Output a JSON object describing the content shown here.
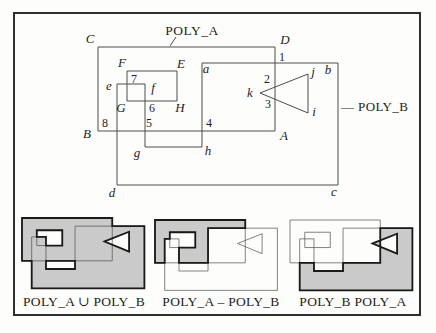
{
  "colors": {
    "paper": "#fdfdfb",
    "frame_stroke": "#2f2f2f",
    "thin_line": "#4d4d4d",
    "thick_line": "#1a1a1a",
    "region_gray": "#cacaca",
    "text": "#1d1d1d"
  },
  "frame": {
    "x": 14,
    "y": 13,
    "w": 406,
    "h": 302
  },
  "diagram": {
    "title": "POLY_A",
    "title_pointer": {
      "x1": 176,
      "y1": 37,
      "x2": 170,
      "y2": 46
    },
    "polyB_label": "— POLY_B",
    "shapes": {
      "polyA": [
        [
          98,
          47
        ],
        [
          275,
          47
        ],
        [
          275,
          131
        ],
        [
          98,
          131
        ]
      ],
      "holeA": [
        [
          127,
          71
        ],
        [
          177,
          71
        ],
        [
          177,
          101
        ],
        [
          127,
          101
        ]
      ],
      "polyB": [
        [
          202,
          63
        ],
        [
          338,
          63
        ],
        [
          338,
          185
        ],
        [
          117,
          185
        ],
        [
          117,
          84
        ],
        [
          145,
          84
        ],
        [
          145,
          147
        ],
        [
          202,
          147
        ]
      ],
      "triangle": [
        [
          260,
          93
        ],
        [
          308,
          74
        ],
        [
          308,
          113
        ]
      ]
    },
    "vertex_labels": [
      {
        "t": "C",
        "x": 90,
        "y": 43
      },
      {
        "t": "D",
        "x": 285,
        "y": 44
      },
      {
        "t": "B",
        "x": 87,
        "y": 138
      },
      {
        "t": "A",
        "x": 284,
        "y": 140
      },
      {
        "t": "F",
        "x": 122,
        "y": 67
      },
      {
        "t": "E",
        "x": 181,
        "y": 68
      },
      {
        "t": "G",
        "x": 121,
        "y": 112
      },
      {
        "t": "H",
        "x": 180,
        "y": 112
      },
      {
        "t": "a",
        "x": 206,
        "y": 73
      },
      {
        "t": "b",
        "x": 328,
        "y": 74
      },
      {
        "t": "c",
        "x": 334,
        "y": 196
      },
      {
        "t": "d",
        "x": 112,
        "y": 197
      },
      {
        "t": "e",
        "x": 109,
        "y": 90
      },
      {
        "t": "f",
        "x": 153,
        "y": 92
      },
      {
        "t": "g",
        "x": 137,
        "y": 157
      },
      {
        "t": "h",
        "x": 208,
        "y": 155
      },
      {
        "t": "j",
        "x": 313,
        "y": 76
      },
      {
        "t": "i",
        "x": 314,
        "y": 116
      },
      {
        "t": "k",
        "x": 250,
        "y": 97
      }
    ],
    "intersection_labels": [
      {
        "t": "1",
        "x": 282,
        "y": 61
      },
      {
        "t": "2",
        "x": 267,
        "y": 83
      },
      {
        "t": "3",
        "x": 268,
        "y": 108
      },
      {
        "t": "4",
        "x": 209,
        "y": 127
      },
      {
        "t": "5",
        "x": 149,
        "y": 127
      },
      {
        "t": "6",
        "x": 152,
        "y": 112
      },
      {
        "t": "7",
        "x": 134,
        "y": 83
      },
      {
        "t": "8",
        "x": 105,
        "y": 127
      }
    ]
  },
  "panels": [
    {
      "label": "POLY_A ∪ POLY_B",
      "label_x": 84,
      "label_y": 306,
      "origin": [
        22,
        218
      ],
      "scale": 0.51,
      "result": {
        "outer": [
          [
            98,
            47
          ],
          [
            275,
            47
          ],
          [
            275,
            63
          ],
          [
            338,
            63
          ],
          [
            338,
            185
          ],
          [
            117,
            185
          ],
          [
            117,
            131
          ],
          [
            98,
            131
          ]
        ],
        "holes": [
          [
            [
              127,
              71
            ],
            [
              177,
              71
            ],
            [
              177,
              101
            ],
            [
              145,
              101
            ],
            [
              145,
              84
            ],
            [
              127,
              84
            ]
          ],
          [
            [
              145,
              131
            ],
            [
              202,
              131
            ],
            [
              202,
              147
            ],
            [
              145,
              147
            ]
          ],
          [
            [
              260,
              93
            ],
            [
              308,
              74
            ],
            [
              308,
              113
            ]
          ]
        ]
      }
    },
    {
      "label": "POLY_A – POLY_B",
      "label_x": 221,
      "label_y": 306,
      "origin": [
        155,
        220
      ],
      "scale": 0.51,
      "result": {
        "outer": [
          [
            98,
            47
          ],
          [
            275,
            47
          ],
          [
            275,
            63
          ],
          [
            202,
            63
          ],
          [
            202,
            131
          ],
          [
            145,
            131
          ],
          [
            145,
            101
          ],
          [
            177,
            101
          ],
          [
            177,
            71
          ],
          [
            127,
            71
          ],
          [
            127,
            84
          ],
          [
            117,
            84
          ],
          [
            117,
            131
          ],
          [
            98,
            131
          ]
        ],
        "holes": []
      }
    },
    {
      "label": "POLY_B  POLY_A",
      "label_x": 353,
      "label_y": 306,
      "origin": [
        290,
        220
      ],
      "scale": 0.51,
      "result": {
        "outer": [
          [
            275,
            63
          ],
          [
            338,
            63
          ],
          [
            338,
            185
          ],
          [
            117,
            185
          ],
          [
            117,
            131
          ],
          [
            145,
            131
          ],
          [
            145,
            147
          ],
          [
            202,
            147
          ],
          [
            202,
            131
          ],
          [
            275,
            131
          ]
        ],
        "holes": [
          [
            [
              260,
              93
            ],
            [
              308,
              74
            ],
            [
              308,
              113
            ]
          ]
        ]
      }
    }
  ]
}
